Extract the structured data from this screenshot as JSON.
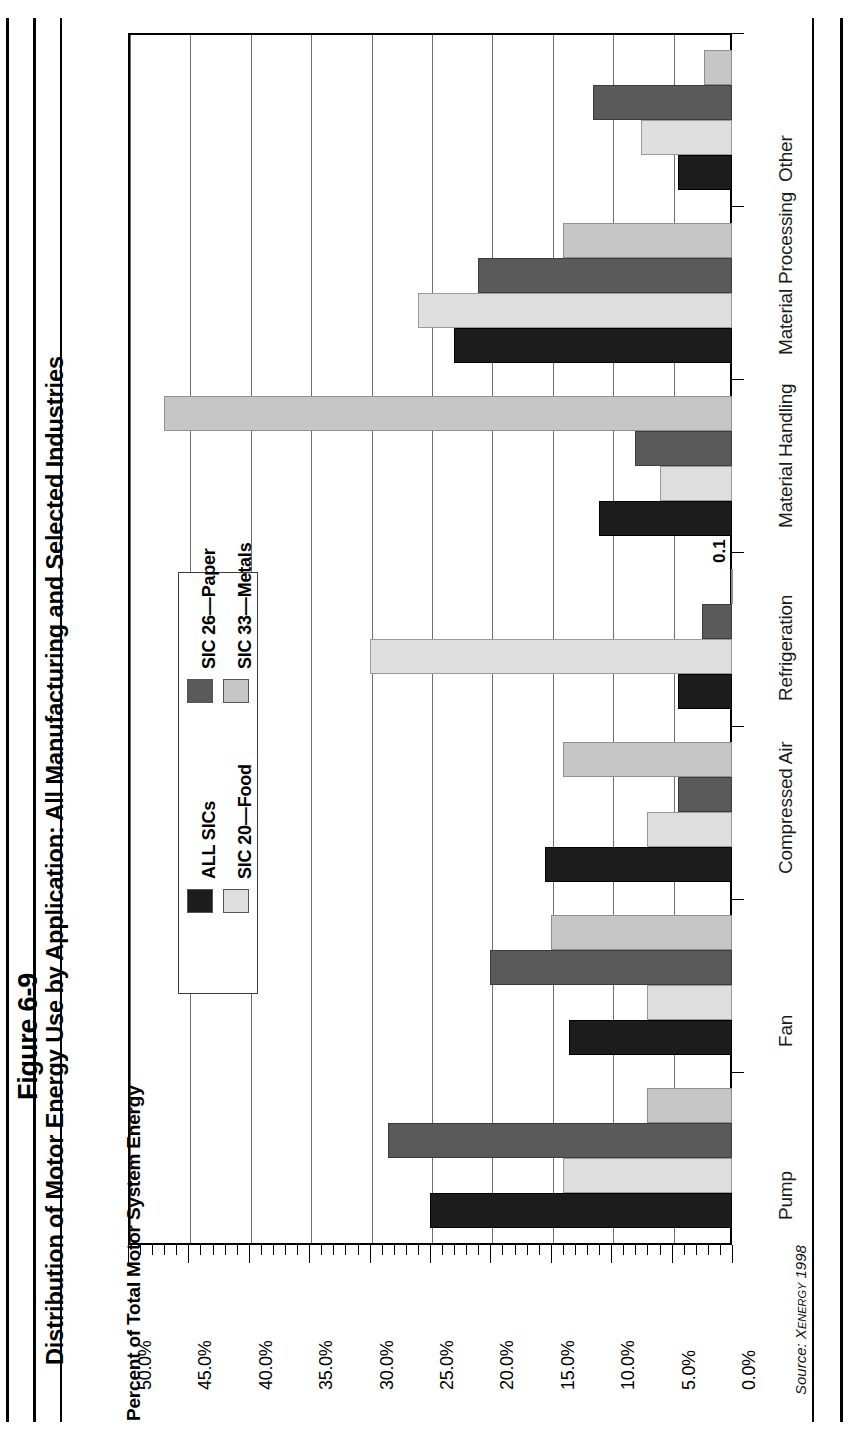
{
  "figure": {
    "number": "Figure 6-9",
    "title": "Distribution of Motor Energy Use by Application: All Manufacturing and Selected Industries",
    "source": "Source: ",
    "source_name": "Xenergy 1998"
  },
  "chart_data": {
    "type": "bar",
    "orientation": "horizontal",
    "title": "Distribution of Motor Energy Use by Application: All Manufacturing and Selected Industries",
    "xlabel": "Percent of Total Motor System Energy",
    "ylabel": "",
    "xlim": [
      0,
      50
    ],
    "grid": true,
    "legend_position": "inside-left",
    "categories": [
      "Pump",
      "Fan",
      "Compressed Air",
      "Refrigeration",
      "Material Handling",
      "Material Processing",
      "Other"
    ],
    "tick_labels": [
      "0.0%",
      "5.0%",
      "10.0%",
      "15.0%",
      "20.0%",
      "25.0%",
      "30.0%",
      "35.0%",
      "40.0%",
      "45.0%",
      "50.0%"
    ],
    "tick_values": [
      0,
      5,
      10,
      15,
      20,
      25,
      30,
      35,
      40,
      45,
      50
    ],
    "series": [
      {
        "name": "ALL SICs",
        "color": "#1c1c1c",
        "values": [
          25.0,
          13.5,
          15.5,
          4.5,
          11.0,
          23.0,
          4.5
        ]
      },
      {
        "name": "SIC 20—Food",
        "color": "#dedede",
        "values": [
          14.0,
          7.0,
          7.0,
          30.0,
          6.0,
          26.0,
          7.5
        ]
      },
      {
        "name": "SIC 26—Paper",
        "color": "#5a5a5a",
        "values": [
          28.5,
          20.0,
          4.5,
          2.5,
          8.0,
          21.0,
          11.5
        ]
      },
      {
        "name": "SIC 33—Metals",
        "color": "#c6c6c6",
        "values": [
          7.0,
          15.0,
          14.0,
          0.1,
          47.0,
          14.0,
          2.3
        ]
      }
    ],
    "annotations": [
      {
        "text": "0.1",
        "category": "Refrigeration",
        "series": "SIC 33—Metals",
        "value": 0.1
      }
    ]
  }
}
